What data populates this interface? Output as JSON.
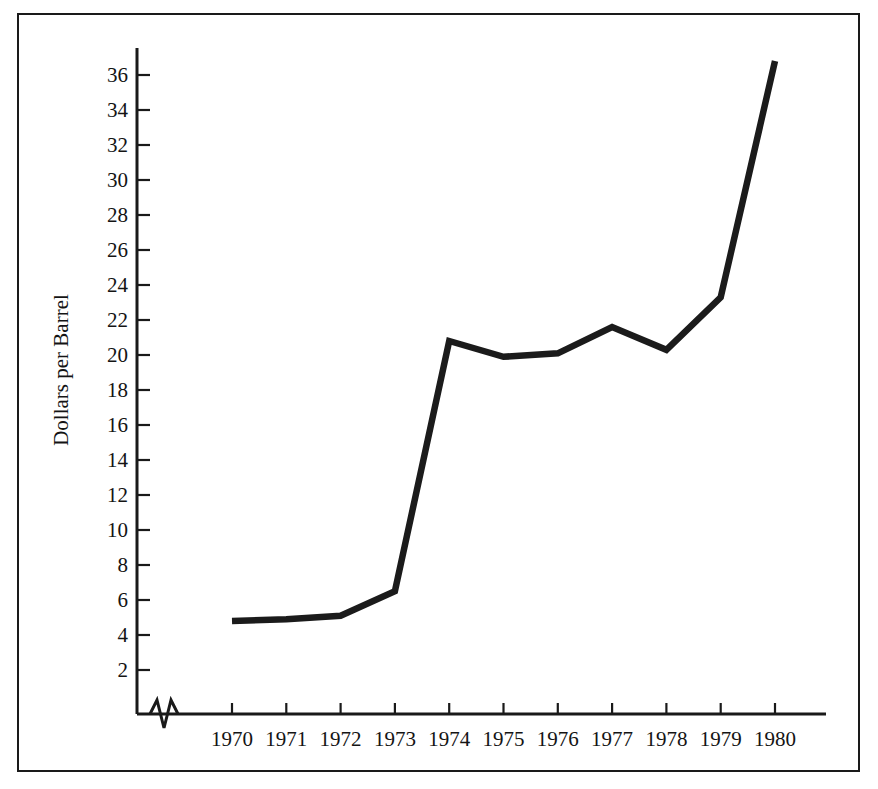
{
  "chart_data": {
    "type": "line",
    "title": "",
    "xlabel": "",
    "ylabel": "Dollars per Barrel",
    "x": [
      1970,
      1971,
      1972,
      1973,
      1974,
      1975,
      1976,
      1977,
      1978,
      1979,
      1980
    ],
    "values": [
      4.8,
      4.9,
      5.1,
      6.5,
      20.8,
      19.9,
      20.1,
      21.6,
      20.3,
      23.3,
      36.8
    ],
    "series": [
      {
        "name": "Dollars per Barrel",
        "values": [
          4.8,
          4.9,
          5.1,
          6.5,
          20.8,
          19.9,
          20.1,
          21.6,
          20.3,
          23.3,
          36.8
        ]
      }
    ],
    "categories": [
      "1970",
      "1971",
      "1972",
      "1973",
      "1974",
      "1975",
      "1976",
      "1977",
      "1978",
      "1979",
      "1980"
    ],
    "xtick_labels": [
      "1970",
      "1971",
      "1972",
      "1973",
      "1974",
      "1975",
      "1976",
      "1977",
      "1978",
      "1979",
      "1980"
    ],
    "ytick_labels": [
      "2",
      "4",
      "6",
      "8",
      "10",
      "12",
      "14",
      "16",
      "18",
      "20",
      "22",
      "24",
      "26",
      "28",
      "30",
      "32",
      "34",
      "36"
    ],
    "ytick_values": [
      2,
      4,
      6,
      8,
      10,
      12,
      14,
      16,
      18,
      20,
      22,
      24,
      26,
      28,
      30,
      32,
      34,
      36
    ],
    "ylim": [
      0,
      38
    ],
    "xlim": [
      1969.6,
      1980.6
    ],
    "grid": false,
    "legend": "none",
    "axis_break": "x-axis zigzag break near origin",
    "line_color": "#1b1b1b",
    "frame_color": "#1a1a1a",
    "background_color": "#ffffff"
  },
  "axes": {
    "y_title": "Dollars per Barrel"
  },
  "ticks": {
    "y": [
      {
        "label": "36",
        "value": 36
      },
      {
        "label": "34",
        "value": 34
      },
      {
        "label": "32",
        "value": 32
      },
      {
        "label": "30",
        "value": 30
      },
      {
        "label": "28",
        "value": 28
      },
      {
        "label": "26",
        "value": 26
      },
      {
        "label": "24",
        "value": 24
      },
      {
        "label": "22",
        "value": 22
      },
      {
        "label": "20",
        "value": 20
      },
      {
        "label": "18",
        "value": 18
      },
      {
        "label": "16",
        "value": 16
      },
      {
        "label": "14",
        "value": 14
      },
      {
        "label": "12",
        "value": 12
      },
      {
        "label": "10",
        "value": 10
      },
      {
        "label": "8",
        "value": 8
      },
      {
        "label": "6",
        "value": 6
      },
      {
        "label": "4",
        "value": 4
      },
      {
        "label": "2",
        "value": 2
      }
    ],
    "x": [
      {
        "label": "1970",
        "value": 1970
      },
      {
        "label": "1971",
        "value": 1971
      },
      {
        "label": "1972",
        "value": 1972
      },
      {
        "label": "1973",
        "value": 1973
      },
      {
        "label": "1974",
        "value": 1974
      },
      {
        "label": "1975",
        "value": 1975
      },
      {
        "label": "1976",
        "value": 1976
      },
      {
        "label": "1977",
        "value": 1977
      },
      {
        "label": "1978",
        "value": 1978
      },
      {
        "label": "1979",
        "value": 1979
      },
      {
        "label": "1980",
        "value": 1980
      }
    ]
  }
}
